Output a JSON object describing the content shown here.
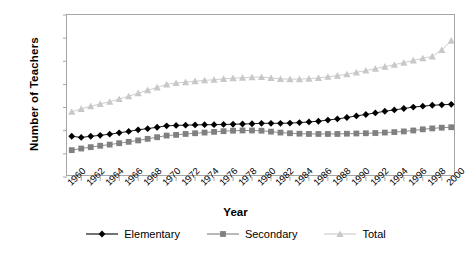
{
  "chart_data": {
    "type": "line",
    "title": "",
    "xlabel": "Year",
    "ylabel": "Number of Teachers",
    "xlim": [
      1959.5,
      2000.5
    ],
    "ylim": [
      0,
      3500000
    ],
    "grid": false,
    "legend_position": "bottom",
    "y_ticks": [
      "0",
      "500000",
      "1000000",
      "1500000",
      "2000000",
      "2500000",
      "3000000",
      "3500000"
    ],
    "y_tick_values": [
      0,
      500000,
      1000000,
      1500000,
      2000000,
      2500000,
      3000000,
      3500000
    ],
    "x_tick_labels": [
      "1960",
      "1962",
      "1964",
      "1966",
      "1968",
      "1970",
      "1972",
      "1974",
      "1976",
      "1978",
      "1980",
      "1982",
      "1984",
      "1986",
      "1988",
      "1990",
      "1992",
      "1994",
      "1996",
      "1998",
      "2000"
    ],
    "x": [
      1960,
      1961,
      1962,
      1963,
      1964,
      1965,
      1966,
      1967,
      1968,
      1969,
      1970,
      1971,
      1972,
      1973,
      1974,
      1975,
      1976,
      1977,
      1978,
      1979,
      1980,
      1981,
      1982,
      1983,
      1984,
      1985,
      1986,
      1987,
      1988,
      1989,
      1990,
      1991,
      1992,
      1993,
      1994,
      1995,
      1996,
      1997,
      1998,
      1999,
      2000
    ],
    "series": [
      {
        "name": "Elementary",
        "color": "#000000",
        "marker": "diamond",
        "values": [
          880000,
          855000,
          880000,
          900000,
          925000,
          955000,
          985000,
          1020000,
          1045000,
          1075000,
          1105000,
          1115000,
          1120000,
          1125000,
          1130000,
          1130000,
          1135000,
          1140000,
          1145000,
          1150000,
          1160000,
          1160000,
          1160000,
          1165000,
          1175000,
          1190000,
          1205000,
          1230000,
          1255000,
          1285000,
          1320000,
          1350000,
          1385000,
          1420000,
          1450000,
          1480000,
          1510000,
          1530000,
          1550000,
          1560000,
          1570000
        ]
      },
      {
        "name": "Secondary",
        "color": "#808080",
        "marker": "square",
        "values": [
          580000,
          615000,
          645000,
          675000,
          700000,
          730000,
          760000,
          790000,
          825000,
          860000,
          895000,
          910000,
          930000,
          945000,
          960000,
          975000,
          990000,
          1000000,
          1005000,
          1005000,
          1000000,
          980000,
          960000,
          945000,
          935000,
          930000,
          930000,
          930000,
          930000,
          935000,
          940000,
          945000,
          950000,
          960000,
          970000,
          985000,
          1005000,
          1030000,
          1050000,
          1065000,
          1075000
        ]
      },
      {
        "name": "Total",
        "color": "#c8c8c8",
        "marker": "triangle",
        "values": [
          1410000,
          1470000,
          1530000,
          1580000,
          1625000,
          1685000,
          1745000,
          1810000,
          1875000,
          1935000,
          2000000,
          2030000,
          2050000,
          2070000,
          2090000,
          2100000,
          2120000,
          2135000,
          2145000,
          2155000,
          2160000,
          2140000,
          2120000,
          2115000,
          2115000,
          2125000,
          2140000,
          2165000,
          2190000,
          2220000,
          2260000,
          2300000,
          2340000,
          2385000,
          2425000,
          2470000,
          2520000,
          2565000,
          2605000,
          2745000,
          2945000
        ]
      }
    ]
  },
  "legend": {
    "items": [
      {
        "label": "Elementary"
      },
      {
        "label": "Secondary"
      },
      {
        "label": "Total"
      }
    ]
  },
  "caption": {
    "text": ""
  }
}
